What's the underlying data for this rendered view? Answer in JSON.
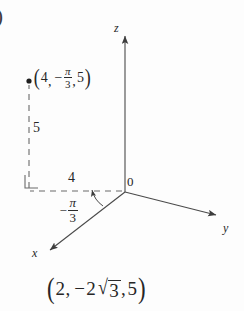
{
  "figure": {
    "enumerator": ")",
    "caption_rect": {
      "open": "(",
      "x": "2",
      "comma1": ",",
      "minus": "−",
      "coefficient": "2",
      "radical": "√",
      "radicand": "3",
      "comma2": ",",
      "z": "5",
      "close": ")"
    },
    "axes": [
      {
        "name": "z-axis",
        "label": "z"
      },
      {
        "name": "y-axis",
        "label": "y"
      },
      {
        "name": "x-axis",
        "label": "x"
      }
    ],
    "origin_label": "0",
    "point_label": {
      "open": "(",
      "r": "4",
      "comma1": ",",
      "minus": "−",
      "theta_num": "π",
      "theta_den": "3",
      "comma2": ",",
      "z": "5",
      "close": ")"
    },
    "measurements": [
      {
        "name": "height-label",
        "value": "5"
      },
      {
        "name": "radius-label",
        "value": "4"
      }
    ],
    "angle_label": {
      "minus": "−",
      "num": "π",
      "den": "3"
    },
    "colors": {
      "ink": "#262626",
      "line": "#4a4a4a",
      "dashed": "#6b6b6b",
      "background": "#fdfdfd"
    }
  }
}
